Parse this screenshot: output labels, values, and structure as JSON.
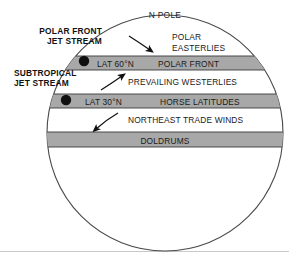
{
  "figure": {
    "title_label": "N POLE",
    "colors": {
      "band_fill": "#a8a8a8",
      "band_stroke": "#3a3a3a",
      "globe_stroke": "#4a4a4a",
      "text": "#1a1a1a",
      "marker": "#111111",
      "frame": "#c9c9c9",
      "background": "#ffffff"
    },
    "globe": {
      "center_x": 165,
      "center_y": 133,
      "radius": 118
    },
    "bands": [
      {
        "id": "polar-front",
        "left_label": "LAT 60°N",
        "right_label": "POLAR FRONT",
        "top_y": 56,
        "bottom_y": 70
      },
      {
        "id": "horse-latitudes",
        "left_label": "LAT 30°N",
        "right_label": "HORSE LATITUDES",
        "top_y": 94,
        "bottom_y": 108
      },
      {
        "id": "doldrums",
        "left_label": "",
        "right_label": "DOLDRUMS",
        "top_y": 132,
        "bottom_y": 147
      }
    ],
    "wind_zones": [
      {
        "id": "polar-easterlies",
        "line1": "POLAR",
        "line2": "EASTERLIES",
        "x": 172,
        "y1": 40,
        "y2": 51
      },
      {
        "id": "prevailing-westerlies",
        "line1": "PREVAILING WESTERLIES",
        "line2": "",
        "x": 128,
        "y1": 85,
        "y2": 0
      },
      {
        "id": "northeast-trade-winds",
        "line1": "NORTHEAST TRADE WINDS",
        "line2": "",
        "x": 128,
        "y1": 123,
        "y2": 0
      }
    ],
    "jet_streams": [
      {
        "id": "polar-front-jet-stream",
        "line1": "POLAR FRONT",
        "line2": "JET STREAM",
        "label_x": 72,
        "label_y1": 34,
        "label_y2": 44,
        "marker_x": 84,
        "marker_y": 61,
        "marker_r": 5.2
      },
      {
        "id": "subtropical-jet-stream",
        "line1": "SUBTROPICAL",
        "line2": "JET STREAM",
        "label_x": 70,
        "label_y1": 76,
        "label_y2": 86,
        "marker_x": 66,
        "marker_y": 100,
        "marker_r": 5.2
      }
    ],
    "arrows": [
      {
        "id": "polar-easterlies-arrow",
        "direction": "down-right",
        "path": "M 129 36 Q 140 43 150 50"
      },
      {
        "id": "prevailing-westerlies-arrow",
        "direction": "up-right",
        "path": "M 101 90 Q 112 83 122 76"
      },
      {
        "id": "northeast-trade-winds-arrow",
        "direction": "down-left",
        "path": "M 118 113 Q 106 120 96 129"
      }
    ]
  }
}
